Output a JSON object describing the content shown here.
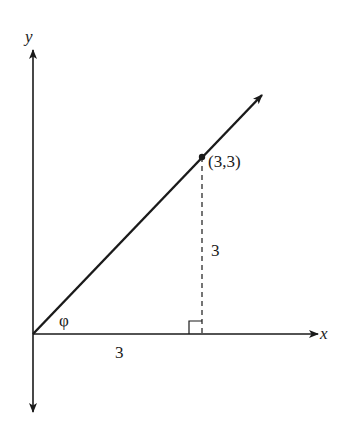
{
  "diagram": {
    "type": "coordinate-geometry",
    "axes": {
      "x_label": "x",
      "y_label": "y"
    },
    "point": {
      "label": "(3,3)",
      "x": 3,
      "y": 3
    },
    "angle": {
      "label": "φ"
    },
    "horizontal_leg": {
      "label": "3"
    },
    "vertical_leg": {
      "label": "3",
      "style": "dashed"
    },
    "right_angle_marker": true,
    "colors": {
      "ink": "#1a1a1a",
      "background": "#ffffff"
    }
  }
}
